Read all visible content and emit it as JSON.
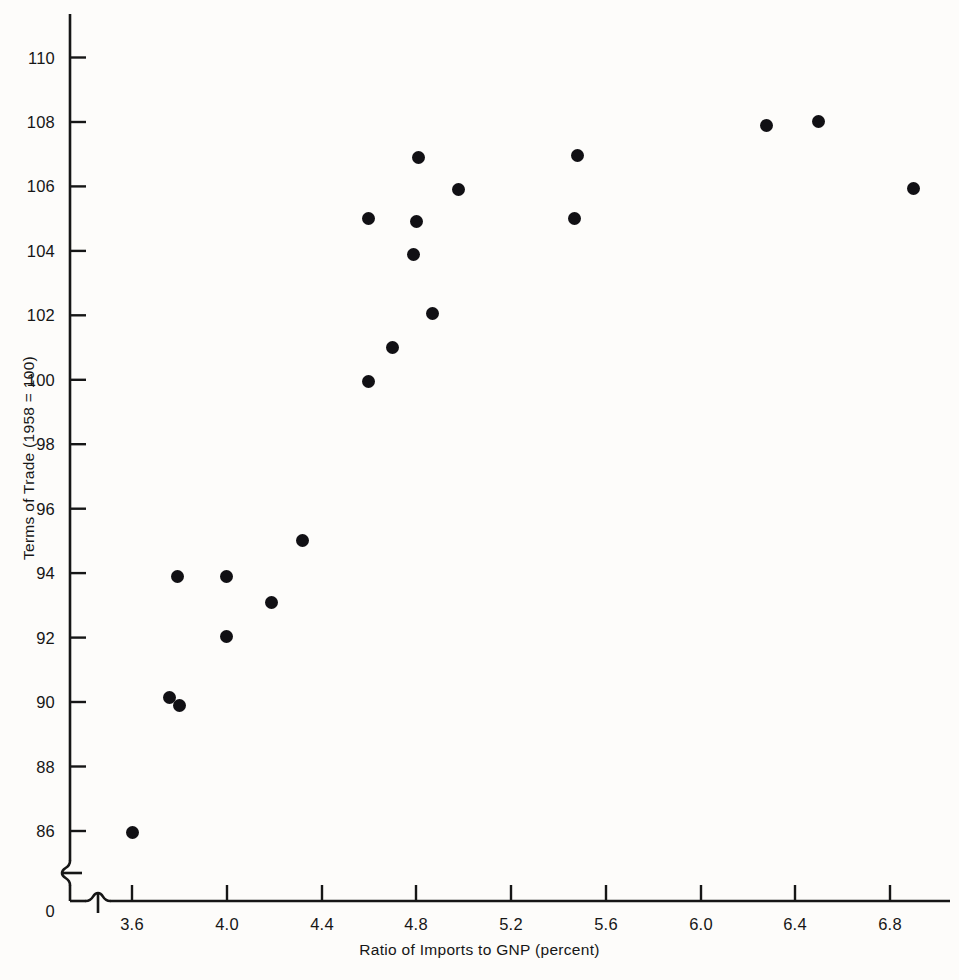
{
  "figure": {
    "background_color": "#fdfcfa",
    "ink_color": "#161616",
    "marker_color": "#111014"
  },
  "axes": {
    "y_title": "Terms of Trade (1958 = 100)",
    "x_title": "Ratio of Imports to GNP (percent)",
    "y_origin_label": "0",
    "y_ticks": [
      "110",
      "108",
      "106",
      "104",
      "102",
      "100",
      "98",
      "96",
      "94",
      "92",
      "90",
      "88",
      "86"
    ],
    "x_ticks": [
      "3.6",
      "4.0",
      "4.4",
      "4.8",
      "5.2",
      "5.6",
      "6.0",
      "6.4",
      "6.8"
    ],
    "y_break_icon": "axis-break-squiggle",
    "x_break_icon": "axis-break-squiggle"
  },
  "chart_data": {
    "type": "scatter",
    "title": "",
    "xlabel": "Ratio of Imports to GNP (percent)",
    "ylabel": "Terms of Trade (1958 = 100)",
    "xlim": [
      3.45,
      7.0
    ],
    "ylim": [
      85.0,
      111.0
    ],
    "xticks": [
      3.6,
      4.0,
      4.4,
      4.8,
      5.2,
      5.6,
      6.0,
      6.4,
      6.8
    ],
    "yticks": [
      86,
      88,
      90,
      92,
      94,
      96,
      98,
      100,
      102,
      104,
      106,
      108,
      110
    ],
    "grid": false,
    "legend": false,
    "axis_breaks": [
      "y-below-86",
      "x-below-3.6"
    ],
    "series": [
      {
        "name": "observations",
        "points": [
          {
            "x": 3.6,
            "y": 85.95
          },
          {
            "x": 3.76,
            "y": 90.15
          },
          {
            "x": 3.8,
            "y": 89.9
          },
          {
            "x": 3.79,
            "y": 93.9
          },
          {
            "x": 4.0,
            "y": 93.9
          },
          {
            "x": 4.0,
            "y": 92.05
          },
          {
            "x": 4.19,
            "y": 93.1
          },
          {
            "x": 4.32,
            "y": 95.0
          },
          {
            "x": 4.6,
            "y": 99.95
          },
          {
            "x": 4.6,
            "y": 105.0
          },
          {
            "x": 4.7,
            "y": 101.0
          },
          {
            "x": 4.79,
            "y": 103.9
          },
          {
            "x": 4.8,
            "y": 104.9
          },
          {
            "x": 4.81,
            "y": 106.9
          },
          {
            "x": 4.87,
            "y": 102.05
          },
          {
            "x": 4.98,
            "y": 105.9
          },
          {
            "x": 5.47,
            "y": 105.0
          },
          {
            "x": 5.48,
            "y": 106.95
          },
          {
            "x": 6.28,
            "y": 107.9
          },
          {
            "x": 6.5,
            "y": 108.0
          },
          {
            "x": 6.9,
            "y": 105.95
          }
        ]
      }
    ]
  }
}
